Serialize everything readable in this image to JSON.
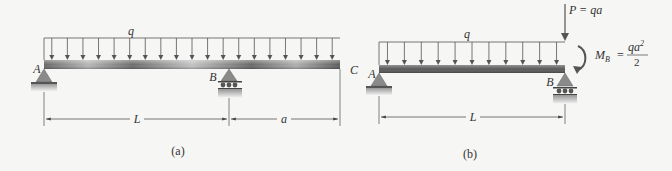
{
  "figure_a": {
    "caption": "(a)",
    "load_label": "q",
    "support_a_label": "A",
    "support_b_label": "B",
    "end_label": "C",
    "dim_left_label": "L",
    "dim_right_label": "a",
    "arrow_count": 19
  },
  "figure_b": {
    "caption": "(b)",
    "load_label": "q",
    "support_a_label": "A",
    "support_b_label": "B",
    "point_load_label": "P = qa",
    "moment_label_lhs": "M",
    "moment_label_sub": "B",
    "moment_label_eq": "=",
    "moment_numerator": "qa",
    "moment_numerator_exp": "2",
    "moment_denominator": "2",
    "dim_label": "L",
    "arrow_count": 11
  },
  "colors": {
    "background": "#f6f6f4",
    "beam_dark": "#555555",
    "beam_light": "#bdbdbd",
    "support": "#8a8a8a",
    "line": "#444444",
    "text": "#333333"
  }
}
